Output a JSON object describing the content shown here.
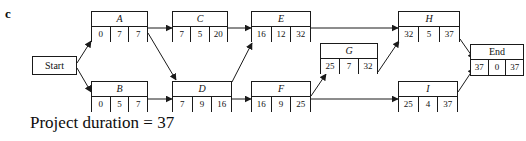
{
  "panel_label": "c",
  "caption": "Project duration = 37",
  "colors": {
    "ink": "#111111",
    "line": "#1a1a1a",
    "background": "#ffffff"
  },
  "diagram": {
    "type": "activity-on-node-network",
    "cell_headers": [
      "earliest start",
      "duration",
      "latest finish"
    ],
    "start_node": {
      "label": "Start"
    },
    "end_node": {
      "label": "End",
      "cells": [
        "37",
        "0",
        "37"
      ]
    },
    "nodes": [
      {
        "id": "A",
        "label": "A",
        "cells": [
          "0",
          "7",
          "7"
        ]
      },
      {
        "id": "B",
        "label": "B",
        "cells": [
          "0",
          "5",
          "7"
        ]
      },
      {
        "id": "C",
        "label": "C",
        "cells": [
          "7",
          "5",
          "20"
        ]
      },
      {
        "id": "D",
        "label": "D",
        "cells": [
          "7",
          "9",
          "16"
        ]
      },
      {
        "id": "E",
        "label": "E",
        "cells": [
          "16",
          "12",
          "32"
        ]
      },
      {
        "id": "F",
        "label": "F",
        "cells": [
          "16",
          "9",
          "25"
        ]
      },
      {
        "id": "G",
        "label": "G",
        "cells": [
          "25",
          "7",
          "32"
        ]
      },
      {
        "id": "H",
        "label": "H",
        "cells": [
          "32",
          "5",
          "37"
        ]
      },
      {
        "id": "I",
        "label": "I",
        "cells": [
          "25",
          "4",
          "37"
        ]
      }
    ],
    "edges": [
      {
        "from": "Start",
        "to": "A"
      },
      {
        "from": "Start",
        "to": "B"
      },
      {
        "from": "A",
        "to": "C"
      },
      {
        "from": "A",
        "to": "D"
      },
      {
        "from": "B",
        "to": "D"
      },
      {
        "from": "C",
        "to": "E"
      },
      {
        "from": "D",
        "to": "E"
      },
      {
        "from": "D",
        "to": "F"
      },
      {
        "from": "E",
        "to": "H"
      },
      {
        "from": "F",
        "to": "G"
      },
      {
        "from": "F",
        "to": "I"
      },
      {
        "from": "G",
        "to": "H"
      },
      {
        "from": "H",
        "to": "End"
      },
      {
        "from": "I",
        "to": "End"
      }
    ]
  }
}
